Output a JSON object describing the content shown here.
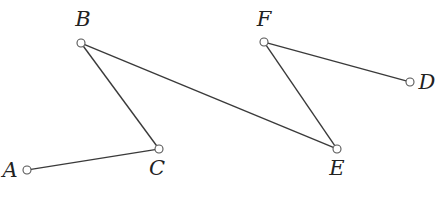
{
  "diagram": {
    "type": "point-segment-graph",
    "points": {
      "A": {
        "label": "A",
        "x": 27,
        "y": 170,
        "label_x": 10,
        "label_y": 177,
        "anchor": "middle"
      },
      "B": {
        "label": "B",
        "x": 81,
        "y": 43,
        "label_x": 83,
        "label_y": 26,
        "anchor": "middle"
      },
      "C": {
        "label": "C",
        "x": 159,
        "y": 149,
        "label_x": 157,
        "label_y": 175,
        "anchor": "middle"
      },
      "D": {
        "label": "D",
        "x": 410,
        "y": 82,
        "label_x": 427,
        "label_y": 89,
        "anchor": "middle"
      },
      "E": {
        "label": "E",
        "x": 337,
        "y": 149,
        "label_x": 337,
        "label_y": 175,
        "anchor": "middle"
      },
      "F": {
        "label": "F",
        "x": 264,
        "y": 42,
        "label_x": 264,
        "label_y": 26,
        "anchor": "middle"
      }
    },
    "segments": [
      {
        "from": "A",
        "to": "C"
      },
      {
        "from": "C",
        "to": "B"
      },
      {
        "from": "B",
        "to": "E"
      },
      {
        "from": "E",
        "to": "F"
      },
      {
        "from": "F",
        "to": "D"
      }
    ],
    "colors": {
      "line": "#3a3a3a",
      "point_stroke": "#555555",
      "point_fill": "#ffffff",
      "label": "#222222"
    }
  }
}
